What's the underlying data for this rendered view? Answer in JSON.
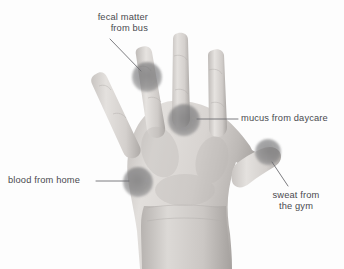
{
  "figure": {
    "background_color": "#fdfdfd",
    "text_color": "#4a4a4f",
    "leader_line_color": "#6d6d72",
    "blob_color": "#6e6e70",
    "skin_tone_light": "#e8e6e4",
    "skin_tone_mid": "#cfcbc8",
    "skin_tone_dark": "#a9a5a2"
  },
  "annotations": [
    {
      "id": "fecal",
      "label": "fecal matter\nfrom bus",
      "align": "right",
      "spot": {
        "cx": 147,
        "cy": 77,
        "r": 15
      },
      "leader": {
        "x1": 110,
        "y1": 39,
        "x2": 141,
        "y2": 71
      }
    },
    {
      "id": "mucus",
      "label": "mucus from daycare",
      "align": "left",
      "spot": {
        "cx": 184,
        "cy": 120,
        "r": 16
      },
      "leader": {
        "x1": 197,
        "y1": 119,
        "x2": 238,
        "y2": 119
      }
    },
    {
      "id": "blood",
      "label": "blood from home",
      "align": "left",
      "spot": {
        "cx": 138,
        "cy": 182,
        "r": 15
      },
      "leader": {
        "x1": 96,
        "y1": 181,
        "x2": 129,
        "y2": 181
      }
    },
    {
      "id": "sweat",
      "label": "sweat from\nthe gym",
      "align": "center",
      "spot": {
        "cx": 268,
        "cy": 152,
        "r": 13
      },
      "leader": {
        "x1": 272,
        "y1": 162,
        "x2": 288,
        "y2": 186
      }
    }
  ]
}
